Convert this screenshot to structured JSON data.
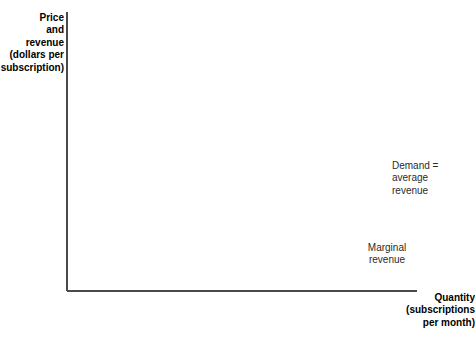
{
  "chart_data": {
    "type": "line",
    "title": "",
    "xlabel": "Quantity (subscriptions per month)",
    "ylabel": "Price and revenue (dollars per subscription)",
    "xlim": [
      0,
      10
    ],
    "ylim": [
      0,
      60
    ],
    "grid": false,
    "legend_position": "inline-annotations",
    "x_ticks": [
      "0",
      "1",
      "2",
      "3",
      "4",
      "5",
      "6",
      "7",
      "8",
      "9",
      "10"
    ],
    "x_tick_values": [
      0,
      1,
      2,
      3,
      4,
      5,
      6,
      7,
      8,
      9,
      10
    ],
    "y_ticks": [
      "0",
      "10",
      "20",
      "30",
      "40",
      "50",
      "$60"
    ],
    "y_tick_values": [
      0,
      10,
      20,
      30,
      40,
      50,
      60
    ],
    "series": [
      {
        "name": "Demand = average revenue",
        "color": "#333333",
        "width": 3.2,
        "points": [
          [
            0,
            60
          ],
          [
            10,
            30
          ]
        ],
        "annotation": "Demand =\naverage\nrevenue"
      },
      {
        "name": "Marginal revenue",
        "color": "#c8c8c8",
        "width": 3.2,
        "points": [
          [
            0.5,
            55.5
          ],
          [
            9.4,
            3
          ]
        ],
        "annotation": "Marginal\nrevenue"
      }
    ]
  },
  "axes": {
    "y_title": "Price\nand\nrevenue\n(dollars per\nsubscription)",
    "x_title": "Quantity\n(subscriptions\nper month)"
  },
  "annotations": {
    "demand": "Demand =\naverage\nrevenue",
    "marginal_revenue": "Marginal\nrevenue"
  },
  "colors": {
    "demand_line": "#333333",
    "marginal_revenue_line": "#c8c8c8",
    "axis": "#4a4a4a",
    "text": "#1a1a1a",
    "background": "#ffffff"
  }
}
